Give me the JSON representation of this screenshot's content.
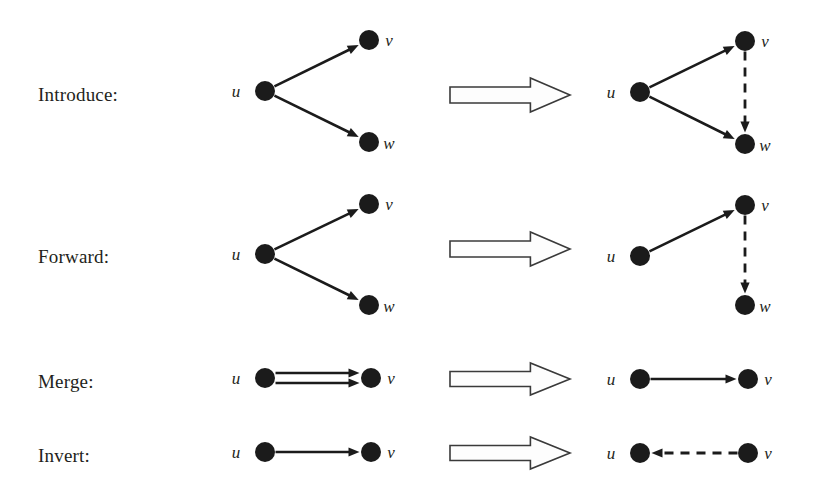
{
  "figure": {
    "background_color": "#ffffff",
    "ink_color": "#1b1b1b",
    "arrow_fill": "#fdfdfd",
    "arrow_stroke": "#3a3a3a"
  },
  "rules": [
    {
      "id": "introduce",
      "label": "Introduce:",
      "label_pos": {
        "x": 38,
        "y": 97
      },
      "before": {
        "nodes": [
          {
            "name": "u",
            "x": 265,
            "y": 91,
            "r": 10,
            "label_pos": {
              "x": 236,
              "y": 97
            }
          },
          {
            "name": "v",
            "x": 369,
            "y": 40,
            "r": 10,
            "label_pos": {
              "x": 389,
              "y": 46
            }
          },
          {
            "name": "w",
            "x": 369,
            "y": 142,
            "r": 10,
            "label_pos": {
              "x": 389,
              "y": 149
            }
          }
        ],
        "edges": [
          {
            "from": "u",
            "to": "v",
            "style": "solid",
            "arrow": true
          },
          {
            "from": "u",
            "to": "w",
            "style": "solid",
            "arrow": true
          }
        ]
      },
      "after": {
        "nodes": [
          {
            "name": "u",
            "x": 640,
            "y": 92,
            "r": 10,
            "label_pos": {
              "x": 611,
              "y": 98
            }
          },
          {
            "name": "v",
            "x": 745,
            "y": 41,
            "r": 10,
            "label_pos": {
              "x": 765,
              "y": 47
            }
          },
          {
            "name": "w",
            "x": 745,
            "y": 144,
            "r": 10,
            "label_pos": {
              "x": 765,
              "y": 151
            }
          }
        ],
        "edges": [
          {
            "from": "u",
            "to": "v",
            "style": "solid",
            "arrow": true
          },
          {
            "from": "u",
            "to": "w",
            "style": "solid",
            "arrow": true
          },
          {
            "from": "v",
            "to": "w",
            "style": "dashed",
            "arrow": true
          }
        ]
      },
      "arrow": {
        "x": 450,
        "y": 78,
        "width": 120,
        "height": 34
      }
    },
    {
      "id": "forward",
      "label": "Forward:",
      "label_pos": {
        "x": 38,
        "y": 259
      },
      "before": {
        "nodes": [
          {
            "name": "u",
            "x": 265,
            "y": 254,
            "r": 10,
            "label_pos": {
              "x": 236,
              "y": 260
            }
          },
          {
            "name": "v",
            "x": 369,
            "y": 204,
            "r": 10,
            "label_pos": {
              "x": 389,
              "y": 210
            }
          },
          {
            "name": "w",
            "x": 369,
            "y": 305,
            "r": 10,
            "label_pos": {
              "x": 389,
              "y": 312
            }
          }
        ],
        "edges": [
          {
            "from": "u",
            "to": "v",
            "style": "solid",
            "arrow": true
          },
          {
            "from": "u",
            "to": "w",
            "style": "solid",
            "arrow": true
          }
        ]
      },
      "after": {
        "nodes": [
          {
            "name": "u",
            "x": 640,
            "y": 256,
            "r": 10,
            "label_pos": {
              "x": 611,
              "y": 262
            }
          },
          {
            "name": "v",
            "x": 745,
            "y": 205,
            "r": 10,
            "label_pos": {
              "x": 765,
              "y": 211
            }
          },
          {
            "name": "w",
            "x": 745,
            "y": 305,
            "r": 10,
            "label_pos": {
              "x": 765,
              "y": 312
            }
          }
        ],
        "edges": [
          {
            "from": "u",
            "to": "v",
            "style": "solid",
            "arrow": true
          },
          {
            "from": "v",
            "to": "w",
            "style": "dashed",
            "arrow": true
          }
        ]
      },
      "arrow": {
        "x": 450,
        "y": 232,
        "width": 120,
        "height": 34
      }
    },
    {
      "id": "merge",
      "label": "Merge:",
      "label_pos": {
        "x": 38,
        "y": 384
      },
      "before": {
        "nodes": [
          {
            "name": "u",
            "x": 265,
            "y": 378,
            "r": 10,
            "label_pos": {
              "x": 236,
              "y": 384
            }
          },
          {
            "name": "v",
            "x": 371,
            "y": 378,
            "r": 10,
            "label_pos": {
              "x": 391,
              "y": 384
            }
          }
        ],
        "edges": [
          {
            "from": "u",
            "to": "v",
            "style": "solid",
            "arrow": true,
            "offset": -5
          },
          {
            "from": "u",
            "to": "v",
            "style": "solid",
            "arrow": true,
            "offset": 5
          }
        ]
      },
      "after": {
        "nodes": [
          {
            "name": "u",
            "x": 640,
            "y": 379,
            "r": 10,
            "label_pos": {
              "x": 611,
              "y": 385
            }
          },
          {
            "name": "v",
            "x": 748,
            "y": 379,
            "r": 10,
            "label_pos": {
              "x": 768,
              "y": 385
            }
          }
        ],
        "edges": [
          {
            "from": "u",
            "to": "v",
            "style": "solid",
            "arrow": true
          }
        ]
      },
      "arrow": {
        "x": 450,
        "y": 363,
        "width": 120,
        "height": 32
      }
    },
    {
      "id": "invert",
      "label": "Invert:",
      "label_pos": {
        "x": 38,
        "y": 458
      },
      "before": {
        "nodes": [
          {
            "name": "u",
            "x": 265,
            "y": 452,
            "r": 10,
            "label_pos": {
              "x": 236,
              "y": 458
            }
          },
          {
            "name": "v",
            "x": 371,
            "y": 452,
            "r": 10,
            "label_pos": {
              "x": 391,
              "y": 458
            }
          }
        ],
        "edges": [
          {
            "from": "u",
            "to": "v",
            "style": "solid",
            "arrow": true
          }
        ]
      },
      "after": {
        "nodes": [
          {
            "name": "u",
            "x": 640,
            "y": 453,
            "r": 10,
            "label_pos": {
              "x": 611,
              "y": 459
            }
          },
          {
            "name": "v",
            "x": 748,
            "y": 453,
            "r": 10,
            "label_pos": {
              "x": 768,
              "y": 459
            }
          }
        ],
        "edges": [
          {
            "from": "v",
            "to": "u",
            "style": "dashed",
            "arrow": true
          }
        ]
      },
      "arrow": {
        "x": 450,
        "y": 437,
        "width": 120,
        "height": 32
      }
    }
  ]
}
